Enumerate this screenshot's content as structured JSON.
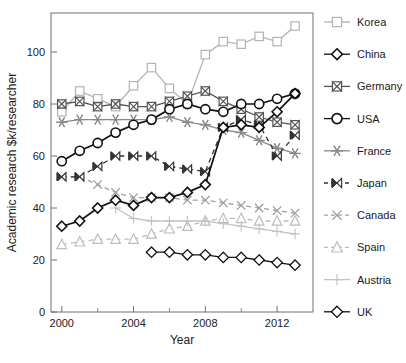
{
  "chart_data": {
    "type": "line",
    "title": "",
    "xlabel": "Year",
    "ylabel": "Academic research $k/researcher",
    "xlim": [
      1999.4,
      2014.0
    ],
    "ylim": [
      0,
      115
    ],
    "xticks_major": [
      2000,
      2004,
      2008,
      2012
    ],
    "xticks_minor": [
      2002,
      2006,
      2010
    ],
    "yticks": [
      0,
      20,
      40,
      60,
      80,
      100
    ],
    "grid": false,
    "legend_position": "right",
    "x": [
      2000,
      2001,
      2002,
      2003,
      2004,
      2005,
      2006,
      2007,
      2008,
      2009,
      2010,
      2011,
      2012,
      2013
    ],
    "series": [
      {
        "name": "Korea",
        "color": "#b3b3b3",
        "marker": "square",
        "dashed": false,
        "x": [
          2000,
          2001,
          2002,
          2003,
          2004,
          2005,
          2006,
          2007,
          2008,
          2009,
          2010,
          2011,
          2012,
          2013
        ],
        "values": [
          77,
          85,
          82,
          79,
          87,
          94,
          86,
          80,
          99,
          104,
          103,
          106,
          104,
          110
        ]
      },
      {
        "name": "China",
        "color": "#111111",
        "marker": "diamond",
        "dashed": false,
        "x": [
          2000,
          2001,
          2002,
          2003,
          2004,
          2005,
          2006,
          2007,
          2008,
          2009,
          2010,
          2011,
          2012,
          2013
        ],
        "values": [
          33,
          35,
          40,
          43,
          41,
          44,
          44,
          46,
          49,
          71,
          72,
          71,
          77,
          84
        ]
      },
      {
        "name": "Germany",
        "color": "#555555",
        "marker": "bowtie",
        "dashed": false,
        "x": [
          2000,
          2001,
          2002,
          2003,
          2004,
          2005,
          2006,
          2007,
          2008,
          2009,
          2010,
          2011,
          2012,
          2013
        ],
        "values": [
          80,
          81,
          79,
          80,
          79,
          79,
          81,
          83,
          85,
          81,
          78,
          75,
          73,
          72
        ]
      },
      {
        "name": "USA",
        "color": "#111111",
        "marker": "circle",
        "dashed": false,
        "x": [
          2000,
          2001,
          2002,
          2003,
          2004,
          2005,
          2006,
          2007,
          2008,
          2009,
          2010,
          2011,
          2012,
          2013
        ],
        "values": [
          58,
          62,
          65,
          69,
          72,
          74,
          78,
          80,
          78,
          77,
          80,
          80,
          82,
          84
        ]
      },
      {
        "name": "France",
        "color": "#8a8a8a",
        "marker": "asterisk",
        "dashed": false,
        "x": [
          2000,
          2001,
          2002,
          2003,
          2004,
          2005,
          2006,
          2007,
          2008,
          2009,
          2010,
          2011,
          2012,
          2013
        ],
        "values": [
          73,
          74,
          74,
          74,
          74,
          74,
          75,
          73,
          72,
          70,
          69,
          66,
          63,
          61
        ]
      },
      {
        "name": "Japan",
        "color": "#333333",
        "marker": "bowtie-filled",
        "dashed": true,
        "x": [
          2000,
          2001,
          2002,
          2003,
          2004,
          2005,
          2006,
          2007,
          2008,
          2009,
          2010,
          2011,
          2012,
          2013
        ],
        "values": [
          52,
          52,
          56,
          60,
          60,
          60,
          56,
          55,
          54,
          71,
          74,
          72,
          60,
          68
        ]
      },
      {
        "name": "Canada",
        "color": "#a0a0a0",
        "marker": "cross",
        "dashed": true,
        "x": [
          2000,
          2001,
          2002,
          2003,
          2004,
          2005,
          2006,
          2007,
          2008,
          2009,
          2010,
          2011,
          2012,
          2013
        ],
        "values": [
          52,
          52,
          49,
          46,
          44,
          44,
          44,
          43,
          43,
          42,
          41,
          40,
          39,
          38
        ]
      },
      {
        "name": "Spain",
        "color": "#bcbcbc",
        "marker": "triangle",
        "dashed": true,
        "x": [
          2000,
          2001,
          2002,
          2003,
          2004,
          2005,
          2006,
          2007,
          2008,
          2009,
          2010,
          2011,
          2012,
          2013
        ],
        "values": [
          26,
          27,
          28,
          28,
          28,
          30,
          32,
          33,
          35,
          36,
          36,
          35,
          35,
          35
        ]
      },
      {
        "name": "Austria",
        "color": "#c4c4c4",
        "marker": "plus",
        "dashed": false,
        "x": [
          2003,
          2004,
          2005,
          2006,
          2007,
          2008,
          2009,
          2010,
          2011,
          2012,
          2013
        ],
        "values": [
          40,
          36,
          35,
          35,
          35,
          35,
          34,
          33,
          32,
          31,
          30
        ]
      },
      {
        "name": "UK",
        "color": "#111111",
        "marker": "diamond-open",
        "dashed": false,
        "x": [
          2005,
          2006,
          2007,
          2008,
          2009,
          2010,
          2011,
          2012,
          2013
        ],
        "values": [
          23,
          23,
          22,
          22,
          21,
          21,
          20,
          19,
          18
        ]
      }
    ]
  },
  "legend": {
    "items": [
      {
        "label": "Korea"
      },
      {
        "label": "China"
      },
      {
        "label": "Germany"
      },
      {
        "label": "USA"
      },
      {
        "label": "France"
      },
      {
        "label": "Japan"
      },
      {
        "label": "Canada"
      },
      {
        "label": "Spain"
      },
      {
        "label": "Austria"
      },
      {
        "label": "UK"
      }
    ]
  }
}
